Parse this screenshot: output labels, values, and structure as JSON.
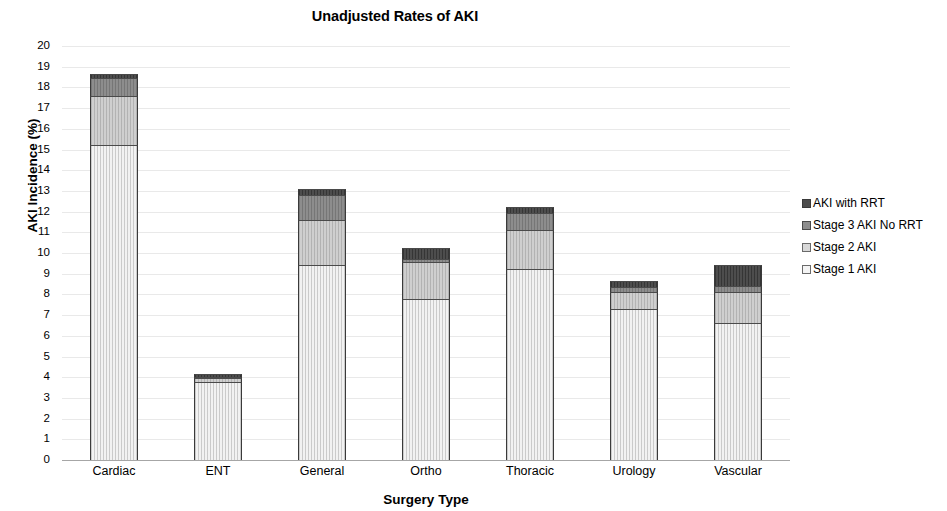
{
  "chart_data": {
    "type": "bar",
    "subtype": "stacked-bar",
    "title": "Unadjusted Rates of AKI",
    "xlabel": "Surgery Type",
    "ylabel": "AKI Incidence (%)",
    "ylim": [
      0,
      20
    ],
    "ytick_step": 1,
    "yticks": [
      "20",
      "19",
      "18",
      "17",
      "16",
      "15",
      "14",
      "13",
      "12",
      "11",
      "10",
      "9",
      "8",
      "7",
      "6",
      "5",
      "4",
      "3",
      "2",
      "1",
      "0"
    ],
    "grid": true,
    "grid_axis": "y",
    "legend_position": "right",
    "categories": [
      "Cardiac",
      "ENT",
      "General",
      "Ortho",
      "Thoracic",
      "Urology",
      "Vascular"
    ],
    "series": [
      {
        "name": "Stage 1 AKI",
        "color": "#f2f2f2",
        "values": [
          15.2,
          3.75,
          9.4,
          7.8,
          9.25,
          7.3,
          6.6
        ]
      },
      {
        "name": "Stage 2 AKI",
        "color": "#cfcfcf",
        "values": [
          2.4,
          0.2,
          2.2,
          1.75,
          1.85,
          0.8,
          1.5
        ]
      },
      {
        "name": "Stage 3 AKI No RRT",
        "color": "#8d8d8d",
        "values": [
          0.85,
          0.05,
          1.2,
          0.15,
          0.85,
          0.25,
          0.3
        ]
      },
      {
        "name": "AKI with RRT",
        "color": "#4d4d4d",
        "values": [
          0.2,
          0.15,
          0.3,
          0.55,
          0.25,
          0.3,
          1.0
        ]
      }
    ],
    "totals": [
      18.65,
      4.15,
      13.1,
      10.25,
      12.2,
      8.65,
      9.4
    ]
  },
  "legend": {
    "items": [
      {
        "label": "AKI with RRT",
        "swatch": "rrt"
      },
      {
        "label": "Stage 3 AKI No RRT",
        "swatch": "stage3"
      },
      {
        "label": "Stage 2 AKI",
        "swatch": "stage2"
      },
      {
        "label": "Stage 1 AKI",
        "swatch": "stage1"
      }
    ]
  }
}
